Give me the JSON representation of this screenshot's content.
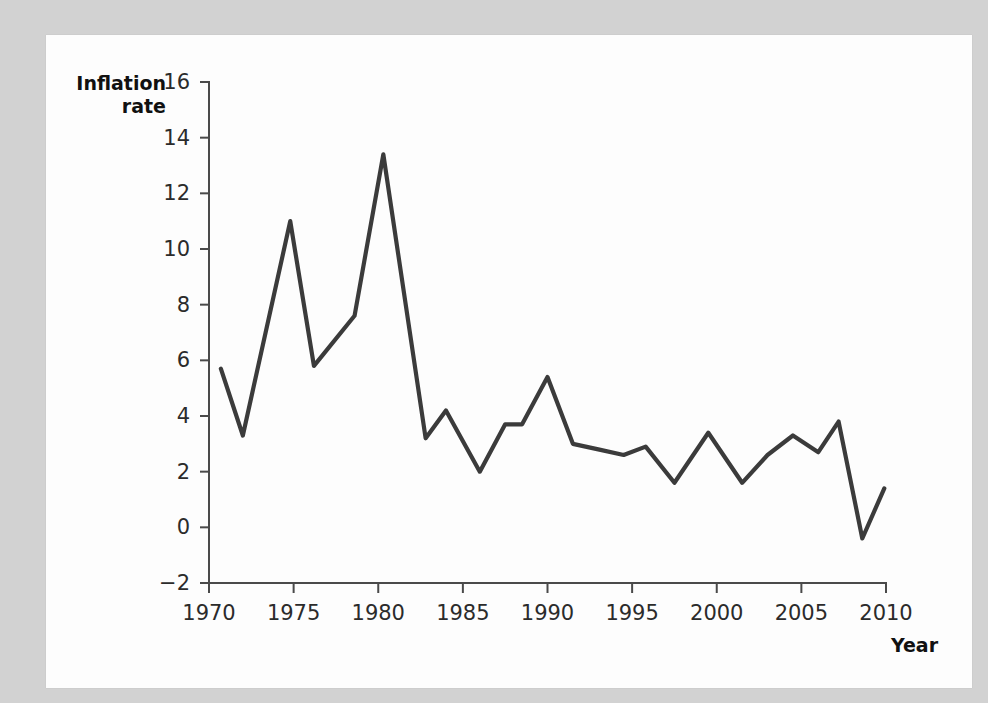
{
  "chart_data": {
    "type": "line",
    "title": "",
    "xlabel": "Year",
    "ylabel": "Inflation rate",
    "xlim": [
      1970,
      2010
    ],
    "ylim": [
      -2,
      16
    ],
    "grid": false,
    "legend": "none",
    "line_color": "#3b3b3b",
    "axis_color": "#4a4a4a",
    "background_color": "#fdfdfd",
    "page_background_color": "#d2d2d2",
    "x_ticks": [
      1970,
      1975,
      1980,
      1985,
      1990,
      1995,
      2000,
      2005,
      2010
    ],
    "x_tick_labels": [
      "1970",
      "1975",
      "1980",
      "1985",
      "1990",
      "1995",
      "2000",
      "2005",
      "2010"
    ],
    "y_ticks": [
      -2,
      0,
      2,
      4,
      6,
      8,
      10,
      12,
      14,
      16
    ],
    "y_tick_labels": [
      "−2",
      "0",
      "2",
      "4",
      "6",
      "8",
      "10",
      "12",
      "14",
      "16"
    ],
    "series": [
      {
        "name": "Inflation rate",
        "x": [
          1970.7,
          1972.0,
          1974.8,
          1976.2,
          1978.6,
          1980.3,
          1982.8,
          1984.0,
          1986.0,
          1987.5,
          1988.5,
          1990.0,
          1991.5,
          1993.0,
          1994.5,
          1995.8,
          1997.5,
          1999.5,
          2001.5,
          2003.0,
          2004.5,
          2006.0,
          2007.2,
          2008.6,
          2009.9
        ],
        "values": [
          5.7,
          3.3,
          11.0,
          5.8,
          7.6,
          13.4,
          3.2,
          4.2,
          2.0,
          3.7,
          3.7,
          5.4,
          3.0,
          2.8,
          2.6,
          2.9,
          1.6,
          3.4,
          1.6,
          2.6,
          3.3,
          2.7,
          3.8,
          -0.4,
          1.4
        ]
      }
    ],
    "annotations": []
  },
  "labels": {
    "y_axis_title_line1": "Inflation",
    "y_axis_title_line2": "rate",
    "x_axis_title": "Year"
  }
}
